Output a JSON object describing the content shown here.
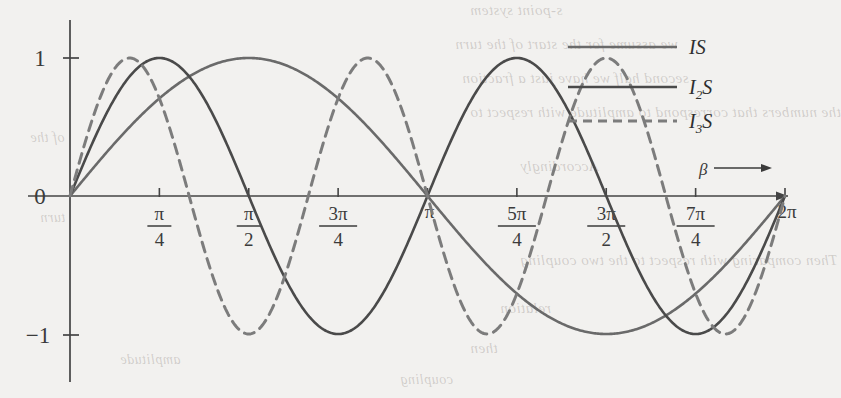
{
  "figure": {
    "title": "",
    "x_axis_label": "β",
    "y_ticks": [
      "1",
      "0",
      "−1"
    ],
    "x_tick_labels": [
      {
        "num": "π",
        "den": "4"
      },
      {
        "num": "π",
        "den": "2"
      },
      {
        "num": "3π",
        "den": "4"
      },
      {
        "num": "π",
        "den": ""
      },
      {
        "num": "5π",
        "den": "4"
      },
      {
        "num": "3π",
        "den": "2"
      },
      {
        "num": "7π",
        "den": "4"
      },
      {
        "num": "2π",
        "den": ""
      }
    ]
  },
  "legend": [
    {
      "label": "IS",
      "sub": "",
      "style": "solid",
      "color": "#6a6a6a"
    },
    {
      "label": "I",
      "sub": "2",
      "tail": "S",
      "style": "solid",
      "color": "#4a4a4a"
    },
    {
      "label": "I",
      "sub": "3",
      "tail": "S",
      "style": "dashed",
      "color": "#7c7c7c"
    }
  ],
  "bleed_text": {
    "b1": "s-point system",
    "b2": "we assume for the start of the turn ",
    "b3": "second half we have just a fraction",
    "b4": "the numbers that correspond to amplitude with respect to",
    "b5": "Accordingly",
    "b6": "Then comparing with respect to the two coupling",
    "b7": "relation",
    "b8": "then",
    "b9": "of the",
    "b10": "turn",
    "b11": "amplitude",
    "b12": "coupling"
  },
  "chart_data": {
    "type": "line",
    "title": "",
    "xlabel": "β",
    "ylabel": "",
    "xlim": [
      0,
      6.283185307179586
    ],
    "ylim": [
      -1.15,
      1.15
    ],
    "grid": false,
    "legend_position": "top-right",
    "x_tick_values": [
      0.7853981634,
      1.5707963268,
      2.3561944902,
      3.1415926536,
      3.926990817,
      4.7123889804,
      5.4977871438,
      6.2831853072
    ],
    "x_tick_labels": [
      "π/4",
      "π/2",
      "3π/4",
      "π",
      "5π/4",
      "3π/2",
      "7π/4",
      "2π"
    ],
    "y_tick_values": [
      1,
      0,
      -1
    ],
    "y_tick_labels": [
      "1",
      "0",
      "−1"
    ],
    "series": [
      {
        "name": "IS",
        "style": "solid",
        "color": "#6a6a6a",
        "formula": "sin(x)",
        "x": [
          0,
          0.3926990817,
          0.7853981634,
          1.1780972451,
          1.5707963268,
          1.9634954085,
          2.3561944902,
          2.7488935719,
          3.1415926536,
          3.5342917353,
          3.926990817,
          4.3196898987,
          4.7123889804,
          5.1050880621,
          5.4977871438,
          5.8904862255,
          6.2831853072
        ],
        "y": [
          0,
          0.3827,
          0.7071,
          0.9239,
          1.0,
          0.9239,
          0.7071,
          0.3827,
          0,
          -0.3827,
          -0.7071,
          -0.9239,
          -1.0,
          -0.9239,
          -0.7071,
          -0.3827,
          0
        ]
      },
      {
        "name": "I2S",
        "style": "solid",
        "color": "#4a4a4a",
        "formula": "sin(2x)",
        "x": [
          0,
          0.3926990817,
          0.7853981634,
          1.1780972451,
          1.5707963268,
          1.9634954085,
          2.3561944902,
          2.7488935719,
          3.1415926536,
          3.5342917353,
          3.926990817,
          4.3196898987,
          4.7123889804,
          5.1050880621,
          5.4977871438,
          5.8904862255,
          6.2831853072
        ],
        "y": [
          0,
          0.7071,
          1.0,
          0.7071,
          0,
          -0.7071,
          -1.0,
          -0.7071,
          0,
          0.7071,
          1.0,
          0.7071,
          0,
          -0.7071,
          -1.0,
          -0.7071,
          0
        ]
      },
      {
        "name": "I3S",
        "style": "dashed",
        "color": "#7c7c7c",
        "formula": "sin(3x)",
        "x": [
          0,
          0.3926990817,
          0.7853981634,
          1.1780972451,
          1.5707963268,
          1.9634954085,
          2.3561944902,
          2.7488935719,
          3.1415926536,
          3.5342917353,
          3.926990817,
          4.3196898987,
          4.7123889804,
          5.1050880621,
          5.4977871438,
          5.8904862255,
          6.2831853072
        ],
        "y": [
          0,
          0.9239,
          0.7071,
          -0.3827,
          -1.0,
          -0.3827,
          0.7071,
          0.9239,
          0,
          -0.9239,
          -0.7071,
          0.3827,
          1.0,
          0.3827,
          -0.7071,
          -0.9239,
          0
        ]
      }
    ]
  }
}
